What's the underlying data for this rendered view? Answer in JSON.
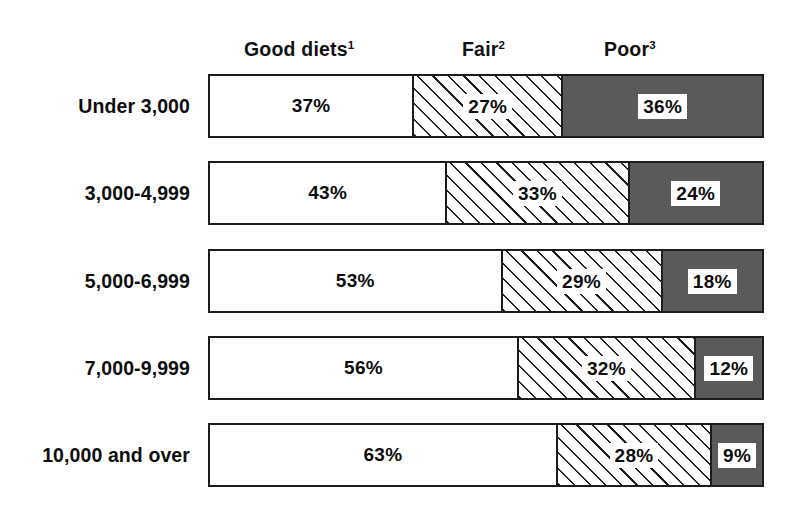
{
  "chart_data": {
    "type": "bar",
    "subtype": "100% stacked horizontal bar",
    "title": "",
    "xlabel": "",
    "ylabel": "",
    "grid": false,
    "legend_position": "top",
    "xlim": [
      0,
      100
    ],
    "categories": [
      "Under 3,000",
      "3,000-4,999",
      "5,000-6,999",
      "7,000-9,999",
      "10,000 and over"
    ],
    "series": [
      {
        "name": "Good diets",
        "footnote": "1",
        "values": [
          37,
          43,
          53,
          56,
          63
        ]
      },
      {
        "name": "Fair",
        "footnote": "2",
        "values": [
          27,
          33,
          29,
          32,
          28
        ]
      },
      {
        "name": "Poor",
        "footnote": "3",
        "values": [
          36,
          24,
          18,
          12,
          9
        ]
      }
    ],
    "value_labels": [
      [
        "37%",
        "27%",
        "36%"
      ],
      [
        "43%",
        "33%",
        "24%"
      ],
      [
        "53%",
        "29%",
        "18%"
      ],
      [
        "56%",
        "32%",
        "12%"
      ],
      [
        "63%",
        "28%",
        "9%"
      ]
    ],
    "colors": {
      "good": "#ffffff",
      "fair": "#ffffff",
      "fair_hatch": "#1c1c1c",
      "poor": "#5a5a5a",
      "outline": "#1c1c1c",
      "text": "#0d0d0d",
      "background": "#ffffff"
    }
  },
  "legend": {
    "good": {
      "label": "Good diets",
      "sup": "1"
    },
    "fair": {
      "label": "Fair",
      "sup": "2"
    },
    "poor": {
      "label": "Poor",
      "sup": "3"
    }
  },
  "rows": [
    {
      "label": "Under 3,000",
      "good": "37%",
      "fair": "27%",
      "poor": "36%",
      "good_w": 37,
      "fair_w": 27,
      "poor_w": 36
    },
    {
      "label": "3,000-4,999",
      "good": "43%",
      "fair": "33%",
      "poor": "24%",
      "good_w": 43,
      "fair_w": 33,
      "poor_w": 24
    },
    {
      "label": "5,000-6,999",
      "good": "53%",
      "fair": "29%",
      "poor": "18%",
      "good_w": 53,
      "fair_w": 29,
      "poor_w": 18
    },
    {
      "label": "7,000-9,999",
      "good": "56%",
      "fair": "32%",
      "poor": "12%",
      "good_w": 56,
      "fair_w": 32,
      "poor_w": 12
    },
    {
      "label": "10,000 and over",
      "good": "63%",
      "fair": "28%",
      "poor": "9%",
      "good_w": 63,
      "fair_w": 28,
      "poor_w": 9
    }
  ]
}
